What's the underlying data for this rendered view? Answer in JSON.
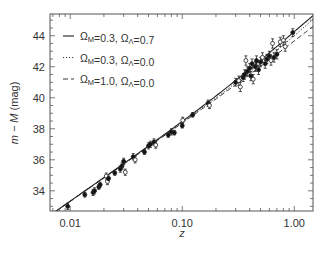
{
  "chart_data": {
    "type": "scatter",
    "title": "",
    "xlabel": "z",
    "ylabel": "m − M (mag)",
    "xscale": "log",
    "xlim": [
      0.0066,
      1.47
    ],
    "ylim": [
      32.7,
      45.4
    ],
    "xticks": [
      0.01,
      0.1,
      1.0
    ],
    "xtick_labels": [
      "0.01",
      "0.10",
      "1.00"
    ],
    "yticks": [
      34,
      36,
      38,
      40,
      42,
      44
    ],
    "ytick_labels": [
      "34",
      "36",
      "38",
      "40",
      "42",
      "44"
    ],
    "grid": false,
    "legend_position": "upper-left",
    "H0": 65,
    "series": [
      {
        "name": "ΩM=0.3, ΩΛ=0.7",
        "omega_m": 0.3,
        "omega_l": 0.7,
        "style": "solid",
        "type": "line"
      },
      {
        "name": "ΩM=0.3, ΩΛ=0.0",
        "omega_m": 0.3,
        "omega_l": 0.0,
        "style": "dotted",
        "type": "line"
      },
      {
        "name": "ΩM=1.0, ΩΛ=0.0",
        "omega_m": 1.0,
        "omega_l": 0.0,
        "style": "dashed",
        "type": "line"
      }
    ],
    "points": [
      {
        "z": 0.0095,
        "mu": 33.0,
        "err": 0.2,
        "filled": true
      },
      {
        "z": 0.0135,
        "mu": 33.75,
        "err": 0.15,
        "filled": true
      },
      {
        "z": 0.016,
        "mu": 33.9,
        "err": 0.2,
        "filled": true
      },
      {
        "z": 0.0165,
        "mu": 34.0,
        "err": 0.2,
        "filled": true
      },
      {
        "z": 0.018,
        "mu": 34.25,
        "err": 0.15,
        "filled": true
      },
      {
        "z": 0.0185,
        "mu": 34.4,
        "err": 0.15,
        "filled": true
      },
      {
        "z": 0.021,
        "mu": 34.95,
        "err": 0.2,
        "filled": false
      },
      {
        "z": 0.0215,
        "mu": 34.6,
        "err": 0.2,
        "filled": false
      },
      {
        "z": 0.022,
        "mu": 34.8,
        "err": 0.15,
        "filled": true
      },
      {
        "z": 0.025,
        "mu": 35.15,
        "err": 0.15,
        "filled": true
      },
      {
        "z": 0.028,
        "mu": 35.4,
        "err": 0.2,
        "filled": true
      },
      {
        "z": 0.029,
        "mu": 35.6,
        "err": 0.2,
        "filled": true
      },
      {
        "z": 0.03,
        "mu": 35.9,
        "err": 0.2,
        "filled": true
      },
      {
        "z": 0.031,
        "mu": 35.2,
        "err": 0.2,
        "filled": false
      },
      {
        "z": 0.0365,
        "mu": 36.2,
        "err": 0.2,
        "filled": true
      },
      {
        "z": 0.038,
        "mu": 36.0,
        "err": 0.2,
        "filled": false
      },
      {
        "z": 0.046,
        "mu": 36.5,
        "err": 0.15,
        "filled": true
      },
      {
        "z": 0.05,
        "mu": 36.9,
        "err": 0.2,
        "filled": true
      },
      {
        "z": 0.052,
        "mu": 37.0,
        "err": 0.2,
        "filled": true
      },
      {
        "z": 0.056,
        "mu": 37.15,
        "err": 0.2,
        "filled": true
      },
      {
        "z": 0.058,
        "mu": 36.95,
        "err": 0.2,
        "filled": false
      },
      {
        "z": 0.075,
        "mu": 37.6,
        "err": 0.15,
        "filled": true
      },
      {
        "z": 0.08,
        "mu": 37.8,
        "err": 0.2,
        "filled": true
      },
      {
        "z": 0.085,
        "mu": 37.75,
        "err": 0.15,
        "filled": true
      },
      {
        "z": 0.1,
        "mu": 38.2,
        "err": 0.15,
        "filled": true
      },
      {
        "z": 0.101,
        "mu": 38.55,
        "err": 0.2,
        "filled": false
      },
      {
        "z": 0.124,
        "mu": 38.9,
        "err": 0.15,
        "filled": true
      },
      {
        "z": 0.17,
        "mu": 39.65,
        "err": 0.2,
        "filled": true
      },
      {
        "z": 0.175,
        "mu": 39.5,
        "err": 0.2,
        "filled": false
      },
      {
        "z": 0.3,
        "mu": 41.0,
        "err": 0.25,
        "filled": true
      },
      {
        "z": 0.32,
        "mu": 41.1,
        "err": 0.3,
        "filled": false
      },
      {
        "z": 0.33,
        "mu": 40.7,
        "err": 0.3,
        "filled": false
      },
      {
        "z": 0.35,
        "mu": 41.3,
        "err": 0.25,
        "filled": true
      },
      {
        "z": 0.36,
        "mu": 41.5,
        "err": 0.3,
        "filled": true
      },
      {
        "z": 0.37,
        "mu": 42.4,
        "err": 0.3,
        "filled": false
      },
      {
        "z": 0.38,
        "mu": 41.7,
        "err": 0.3,
        "filled": true
      },
      {
        "z": 0.4,
        "mu": 41.9,
        "err": 0.3,
        "filled": true
      },
      {
        "z": 0.41,
        "mu": 41.4,
        "err": 0.3,
        "filled": true
      },
      {
        "z": 0.42,
        "mu": 42.2,
        "err": 0.3,
        "filled": true
      },
      {
        "z": 0.43,
        "mu": 41.2,
        "err": 0.3,
        "filled": false
      },
      {
        "z": 0.45,
        "mu": 42.0,
        "err": 0.3,
        "filled": true
      },
      {
        "z": 0.46,
        "mu": 42.4,
        "err": 0.3,
        "filled": true
      },
      {
        "z": 0.48,
        "mu": 41.8,
        "err": 0.3,
        "filled": true
      },
      {
        "z": 0.5,
        "mu": 42.3,
        "err": 0.3,
        "filled": true
      },
      {
        "z": 0.52,
        "mu": 42.6,
        "err": 0.3,
        "filled": false
      },
      {
        "z": 0.55,
        "mu": 42.2,
        "err": 0.3,
        "filled": true
      },
      {
        "z": 0.57,
        "mu": 42.5,
        "err": 0.3,
        "filled": true
      },
      {
        "z": 0.6,
        "mu": 42.7,
        "err": 0.3,
        "filled": true
      },
      {
        "z": 0.62,
        "mu": 42.4,
        "err": 0.3,
        "filled": false
      },
      {
        "z": 0.64,
        "mu": 43.5,
        "err": 0.3,
        "filled": false
      },
      {
        "z": 0.66,
        "mu": 42.6,
        "err": 0.3,
        "filled": true
      },
      {
        "z": 0.7,
        "mu": 42.8,
        "err": 0.3,
        "filled": true
      },
      {
        "z": 0.75,
        "mu": 43.6,
        "err": 0.3,
        "filled": false
      },
      {
        "z": 0.8,
        "mu": 43.7,
        "err": 0.3,
        "filled": false
      },
      {
        "z": 0.83,
        "mu": 43.3,
        "err": 0.3,
        "filled": false
      },
      {
        "z": 0.97,
        "mu": 44.2,
        "err": 0.25,
        "filled": true
      }
    ]
  },
  "legend": {
    "entries": [
      {
        "line": "solid",
        "label_pre": "Ω",
        "sub1": "M",
        "mid": "=0.3, Ω",
        "sub2": "Λ",
        "post": "=0.7"
      },
      {
        "line": "dotted",
        "label_pre": "Ω",
        "sub1": "M",
        "mid": "=0.3, Ω",
        "sub2": "Λ",
        "post": "=0.0"
      },
      {
        "line": "dashed",
        "label_pre": "Ω",
        "sub1": "M",
        "mid": "=1.0, Ω",
        "sub2": "Λ",
        "post": "=0.0"
      }
    ]
  },
  "axes": {
    "x_label": "z",
    "y_label_italic": "m − M",
    "y_label_unit": " (mag)"
  }
}
